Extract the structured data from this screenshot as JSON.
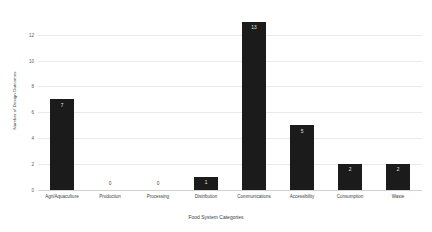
{
  "chart_data": {
    "type": "bar",
    "title": "",
    "xlabel": "Food System Categories",
    "ylabel": "Number of Design Outcomes",
    "categories": [
      "Agri/Aquaculture",
      "Production",
      "Processing",
      "Distribution",
      "Communications",
      "Accessibility",
      "Consumption",
      "Waste"
    ],
    "values": [
      7,
      0,
      0,
      1,
      13,
      5,
      2,
      2
    ],
    "value_labels": [
      "7",
      "0",
      "0",
      "1",
      "13",
      "5",
      "2",
      "2"
    ],
    "ylim": [
      0,
      13.6
    ],
    "yticks": [
      0,
      2,
      4,
      6,
      8,
      10,
      12
    ],
    "ytick_labels": [
      "0",
      "2",
      "4",
      "6",
      "8",
      "10",
      "12"
    ],
    "grid": true,
    "legend": false,
    "bar_color": "#1b1b1b",
    "grid_color": "#e9e9e9",
    "axis_color": "#d2d2d2",
    "background": "#ffffff"
  }
}
